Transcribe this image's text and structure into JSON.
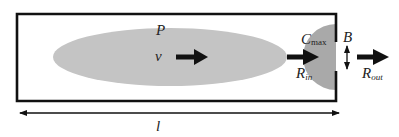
{
  "diagram": {
    "labels": {
      "pressure": "P",
      "velocity": "v",
      "concentration_main": "C",
      "concentration_sub": "max",
      "width": "B",
      "r_in_main": "R",
      "r_in_sub": "in",
      "r_out_main": "R",
      "r_out_sub": "out",
      "length": "l"
    },
    "colors": {
      "outline": "#111111",
      "ellipse_fill": "#c4c4c4",
      "accumulation_fill": "#a9a9a9",
      "arrow": "#111111",
      "background": "#ffffff"
    }
  }
}
